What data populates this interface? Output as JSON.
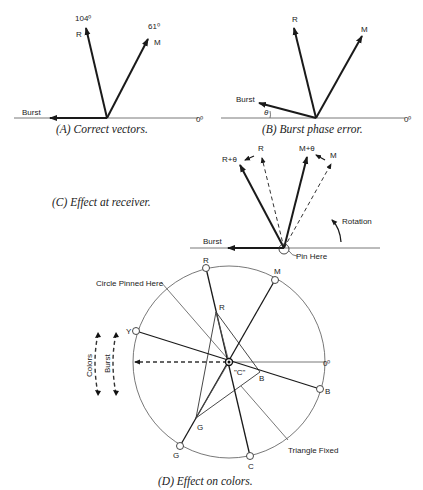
{
  "figure": {
    "panels": [
      {
        "id": "A",
        "caption": "(A) Correct vectors.",
        "labels": {
          "r": "R",
          "r_angle": "104⁰",
          "m": "M",
          "m_angle": "61⁰",
          "burst": "Burst",
          "zero": "0⁰"
        }
      },
      {
        "id": "B",
        "caption": "(B) Burst phase error.",
        "labels": {
          "r": "R",
          "m": "M",
          "burst": "Burst",
          "theta": "θ",
          "zero": "0⁰"
        }
      },
      {
        "id": "C",
        "caption": "(C) Effect at receiver.",
        "labels": {
          "r_theta": "R+θ",
          "r": "R",
          "m_theta": "M+θ",
          "m": "M",
          "rotation": "Rotation",
          "burst": "Burst",
          "pin": "Pin Here"
        }
      },
      {
        "id": "D",
        "caption": "(D) Effect on colors.",
        "labels": {
          "circle_pinned": "Circle Pinned Here",
          "triangle_fixed": "Triangle Fixed",
          "outer_r": "R",
          "outer_m": "M",
          "outer_y": "Y",
          "outer_b": "B",
          "outer_g": "G",
          "outer_c": "C",
          "inner_r": "R",
          "inner_b": "B",
          "inner_g": "G",
          "center": "\"C\"",
          "zero": "0⁰",
          "colors": "Colors",
          "burst": "Burst"
        }
      }
    ]
  }
}
